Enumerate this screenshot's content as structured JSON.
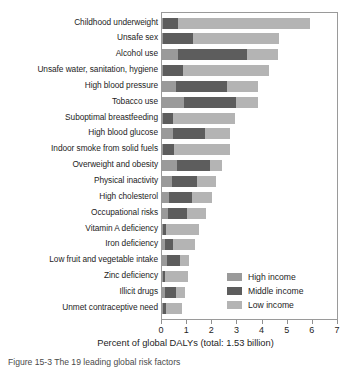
{
  "chart_data": {
    "type": "bar",
    "orientation": "horizontal",
    "stacked": true,
    "title": "",
    "xlabel": "Percent of global DALYs (total: 1.53 billion)",
    "ylabel": "",
    "xlim": [
      0,
      7
    ],
    "xticks": [
      "0",
      "1",
      "2",
      "3",
      "4",
      "5",
      "6",
      "7"
    ],
    "grid": false,
    "legend_position": "lower right",
    "categories": [
      "Childhood underweight",
      "Unsafe sex",
      "Alcohol use",
      "Unsafe water, sanitation, hygiene",
      "High blood pressure",
      "Tobacco use",
      "Suboptimal breastfeeding",
      "High blood glucose",
      "Indoor smoke from solid fuels",
      "Overweight and obesity",
      "Physical inactivity",
      "High cholesterol",
      "Occupational risks",
      "Vitamin A deficiency",
      "Iron deficiency",
      "Low fruit and vegetable intake",
      "Zinc deficiency",
      "Illicit drugs",
      "Unmet contraceptive need"
    ],
    "series": [
      {
        "name": "High income",
        "color": "#9a9a9a",
        "values": [
          0.02,
          0.05,
          0.62,
          0.03,
          0.55,
          0.88,
          0.02,
          0.42,
          0.03,
          0.58,
          0.4,
          0.28,
          0.22,
          0.02,
          0.1,
          0.18,
          0.02,
          0.1,
          0.02
        ]
      },
      {
        "name": "Middle income",
        "color": "#5d5d5d",
        "values": [
          0.6,
          1.18,
          2.78,
          0.8,
          2.05,
          2.05,
          0.42,
          1.28,
          0.45,
          1.32,
          1.0,
          0.92,
          0.78,
          0.12,
          0.32,
          0.52,
          0.1,
          0.45,
          0.15
        ]
      },
      {
        "name": "Low income",
        "color": "#b4b4b4",
        "values": [
          5.28,
          3.42,
          1.2,
          3.42,
          1.2,
          0.87,
          2.46,
          1.0,
          2.22,
          0.5,
          0.75,
          0.8,
          0.75,
          1.32,
          0.9,
          0.38,
          0.93,
          0.35,
          0.62
        ]
      }
    ],
    "totals": [
      5.9,
      4.65,
      4.6,
      4.25,
      3.8,
      3.8,
      2.9,
      2.7,
      2.7,
      2.4,
      2.15,
      2.0,
      1.75,
      1.46,
      1.32,
      1.08,
      1.05,
      0.9,
      0.79
    ]
  },
  "legend": {
    "items": [
      {
        "label": "High income",
        "color": "#9a9a9a"
      },
      {
        "label": "Middle income",
        "color": "#5d5d5d"
      },
      {
        "label": "Low income",
        "color": "#b4b4b4"
      }
    ]
  },
  "caption": {
    "text": "Figure 15-3  The 19 leading global risk factors"
  }
}
